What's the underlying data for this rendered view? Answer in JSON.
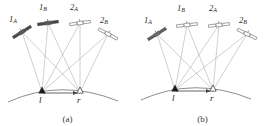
{
  "figure": {
    "type": "scientific-diagram",
    "panels": [
      {
        "id": "a",
        "caption": "(a)",
        "satellites": [
          {
            "name": "1A",
            "label_main": "1",
            "label_sub": "A",
            "fill": "dark",
            "x": 22,
            "y": 30,
            "angle": -32,
            "label_x": 10,
            "label_y": 16
          },
          {
            "name": "1B",
            "label_main": "1",
            "label_sub": "B",
            "fill": "dark",
            "x": 48,
            "y": 20,
            "angle": -8,
            "label_x": 40,
            "label_y": 4
          },
          {
            "name": "2A",
            "label_main": "2",
            "label_sub": "A",
            "fill": "light",
            "x": 80,
            "y": 20,
            "angle": -8,
            "label_x": 71,
            "label_y": 4
          },
          {
            "name": "2B",
            "label_main": "2",
            "label_sub": "B",
            "fill": "light",
            "x": 108,
            "y": 32,
            "angle": 28,
            "label_x": 101,
            "label_y": 17
          }
        ],
        "ground_stations": [
          {
            "name": "l",
            "label": "l",
            "marker": "filled-triangle",
            "x": 42,
            "y": 92
          },
          {
            "name": "r",
            "label": "r",
            "marker": "open-triangle",
            "x": 80,
            "y": 92
          }
        ],
        "baseline_arrow": {
          "from_x": 42,
          "to_x": 80,
          "y": 92,
          "direction": "right"
        }
      },
      {
        "id": "b",
        "caption": "(b)",
        "satellites": [
          {
            "name": "1A",
            "label_main": "1",
            "label_sub": "A",
            "fill": "dark",
            "x": 22,
            "y": 32,
            "angle": -32,
            "label_x": 10,
            "label_y": 17
          },
          {
            "name": "1B",
            "label_main": "1",
            "label_sub": "B",
            "fill": "light",
            "x": 52,
            "y": 22,
            "angle": -6,
            "label_x": 43,
            "label_y": 5
          },
          {
            "name": "2A",
            "label_main": "2",
            "label_sub": "A",
            "fill": "light",
            "x": 84,
            "y": 22,
            "angle": -6,
            "label_x": 75,
            "label_y": 5
          },
          {
            "name": "2B",
            "label_main": "2",
            "label_sub": "B",
            "fill": "light",
            "x": 112,
            "y": 32,
            "angle": 26,
            "label_x": 105,
            "label_y": 17
          }
        ],
        "ground_stations": [
          {
            "name": "l",
            "label": "l",
            "marker": "filled-triangle",
            "x": 40,
            "y": 90
          },
          {
            "name": "r",
            "label": "r",
            "marker": "open-triangle",
            "x": 78,
            "y": 90
          }
        ],
        "baseline_arrow": {
          "from_x": 40,
          "to_x": 78,
          "y": 90,
          "direction": "right"
        }
      }
    ],
    "colors": {
      "satellite_dark": "#5a5a5a",
      "satellite_dark_stroke": "#2f2f2f",
      "satellite_light": "#ffffff",
      "satellite_light_stroke": "#6b6b6b",
      "sight_line": "#a9a9a9",
      "earth_arc": "#6e6e6e",
      "marker_filled": "#1a1a1a",
      "marker_open": "#ffffff",
      "marker_stroke": "#2a2a2a",
      "baseline": "#555555",
      "text": "#2b2b2b",
      "background": "#ffffff"
    }
  }
}
